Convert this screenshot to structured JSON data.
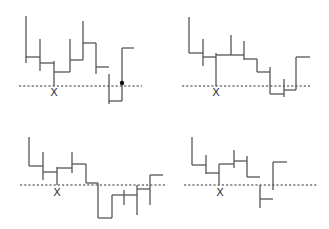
{
  "diagram": {
    "type": "step-path-panels",
    "panel_count": 4,
    "line_color": "#555555",
    "baseline_color": "#333333",
    "marker_label": "X",
    "panels": [
      {
        "id": "top-left",
        "baseline_y": 86,
        "baseline_x": [
          19,
          142
        ],
        "marker": {
          "x": 54,
          "y": 92,
          "label": "X"
        },
        "dot": {
          "x": 122,
          "y": 83
        },
        "segments": [
          [
            26,
            16,
            26,
            63
          ],
          [
            26,
            57,
            40,
            57
          ],
          [
            40,
            39,
            40,
            71
          ],
          [
            40,
            63,
            54,
            63
          ],
          [
            54,
            61,
            54,
            86
          ],
          [
            54,
            72,
            70,
            72
          ],
          [
            70,
            39,
            70,
            72
          ],
          [
            70,
            60,
            83,
            60
          ],
          [
            83,
            21,
            83,
            60
          ],
          [
            83,
            43,
            96,
            43
          ],
          [
            96,
            43,
            96,
            74
          ],
          [
            96,
            67,
            109,
            67
          ],
          [
            109,
            74,
            109,
            104
          ],
          [
            109,
            101,
            122,
            101
          ],
          [
            122,
            48,
            122,
            101
          ],
          [
            122,
            48,
            134,
            48
          ]
        ]
      },
      {
        "id": "top-right",
        "baseline_y": 86,
        "baseline_x": [
          182,
          310
        ],
        "marker": {
          "x": 216,
          "y": 92,
          "label": "X"
        },
        "segments": [
          [
            189,
            17,
            189,
            53
          ],
          [
            189,
            53,
            203,
            53
          ],
          [
            203,
            39,
            203,
            66
          ],
          [
            203,
            57,
            216,
            57
          ],
          [
            216,
            53,
            216,
            86
          ],
          [
            216,
            55,
            244,
            55
          ],
          [
            231,
            35,
            231,
            55
          ],
          [
            244,
            41,
            244,
            60
          ],
          [
            244,
            59,
            257,
            59
          ],
          [
            257,
            59,
            257,
            72
          ],
          [
            257,
            72,
            270,
            72
          ],
          [
            270,
            67,
            270,
            94
          ],
          [
            270,
            94,
            284,
            94
          ],
          [
            284,
            79,
            284,
            97
          ],
          [
            284,
            90,
            296,
            90
          ],
          [
            296,
            57,
            296,
            90
          ],
          [
            296,
            57,
            310,
            57
          ]
        ]
      },
      {
        "id": "bottom-left",
        "baseline_y": 185,
        "baseline_x": [
          20,
          165
        ],
        "marker": {
          "x": 57,
          "y": 192,
          "label": "X"
        },
        "segments": [
          [
            29,
            137,
            29,
            166
          ],
          [
            29,
            166,
            43,
            166
          ],
          [
            43,
            152,
            43,
            180
          ],
          [
            43,
            172,
            57,
            172
          ],
          [
            57,
            167,
            57,
            185
          ],
          [
            57,
            168,
            72,
            168
          ],
          [
            72,
            152,
            72,
            173
          ],
          [
            72,
            164,
            86,
            164
          ],
          [
            86,
            164,
            86,
            183
          ],
          [
            86,
            183,
            98,
            183
          ],
          [
            98,
            183,
            98,
            218
          ],
          [
            98,
            218,
            112,
            218
          ],
          [
            112,
            195,
            112,
            218
          ],
          [
            112,
            195,
            137,
            195
          ],
          [
            124,
            190,
            124,
            205
          ],
          [
            137,
            185,
            137,
            215
          ],
          [
            137,
            189,
            150,
            189
          ],
          [
            150,
            175,
            150,
            205
          ],
          [
            150,
            175,
            163,
            175
          ]
        ]
      },
      {
        "id": "bottom-right",
        "baseline_y": 185,
        "baseline_x": [
          184,
          318
        ],
        "marker": {
          "x": 220,
          "y": 192,
          "label": "X"
        },
        "segments": [
          [
            192,
            137,
            192,
            165
          ],
          [
            192,
            165,
            206,
            165
          ],
          [
            206,
            155,
            206,
            174
          ],
          [
            206,
            173,
            219,
            173
          ],
          [
            219,
            164,
            219,
            185
          ],
          [
            219,
            164,
            234,
            164
          ],
          [
            234,
            150,
            234,
            168
          ],
          [
            234,
            161,
            247,
            161
          ],
          [
            247,
            156,
            247,
            177
          ],
          [
            247,
            177,
            260,
            177
          ],
          [
            260,
            185,
            260,
            208
          ],
          [
            260,
            199,
            273,
            199
          ],
          [
            273,
            162,
            273,
            190
          ],
          [
            273,
            162,
            287,
            162
          ]
        ]
      }
    ]
  }
}
